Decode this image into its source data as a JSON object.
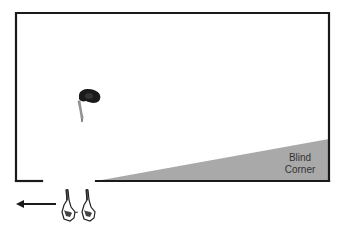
{
  "diagram": {
    "type": "floor-plan",
    "room": {
      "wall_color": "#1a1a1a",
      "has_doorway_gap": true
    },
    "blind_corner": {
      "label_lines": [
        "Blind",
        "Corner"
      ],
      "fill_color": "#a9a9a9"
    },
    "figures": [
      {
        "id": "person-in-room",
        "description": "person viewed from above, facing down toward doorway"
      },
      {
        "id": "person-pair-outside",
        "description": "two people viewed from above at the doorway"
      }
    ],
    "arrow": {
      "direction": "left",
      "color": "#1a1a1a"
    }
  }
}
